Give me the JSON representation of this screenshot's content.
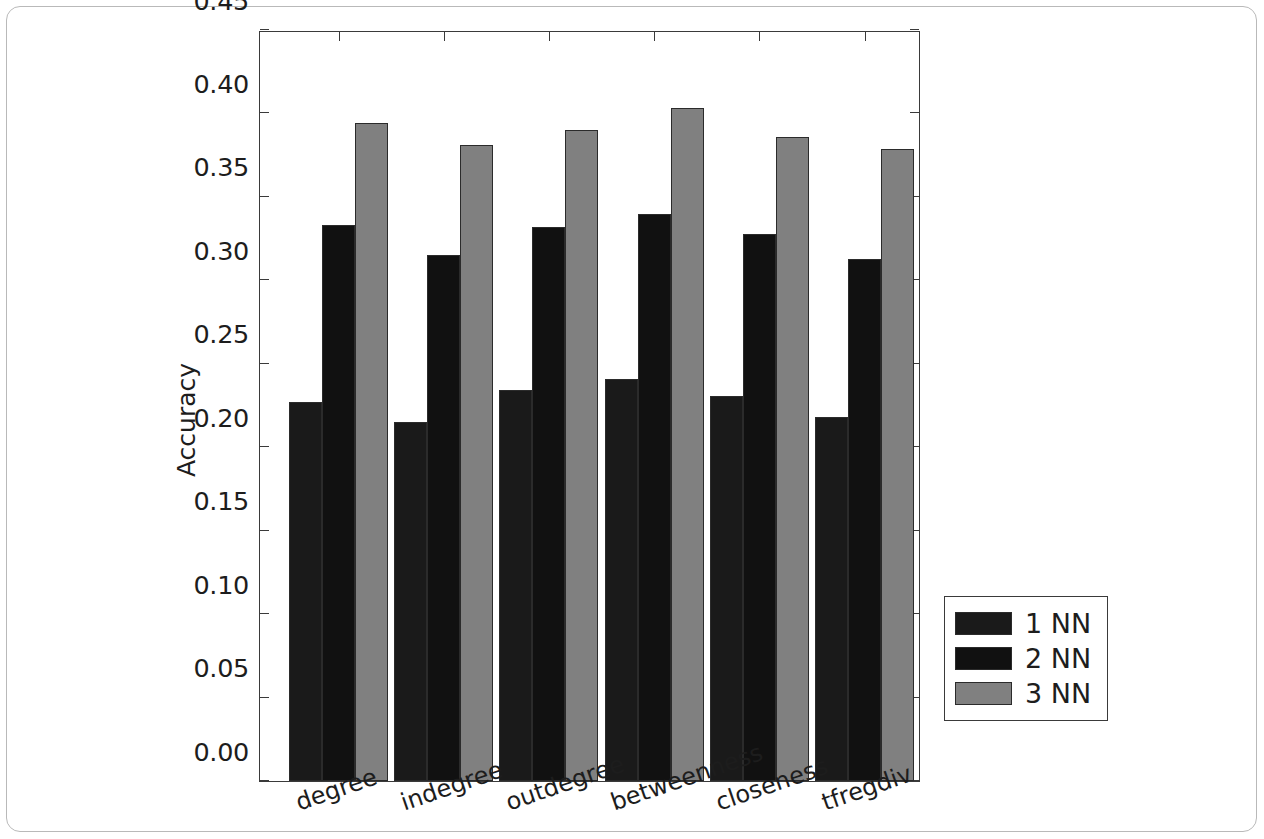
{
  "chart_data": {
    "type": "bar",
    "title": "",
    "xlabel": "",
    "ylabel": "Accuracy",
    "categories": [
      "degree",
      "indegree",
      "outdegree",
      "betweenness",
      "closeness",
      "tfregdiv"
    ],
    "series": [
      {
        "name": "1 NN",
        "color": "#1a1a1a",
        "values": [
          0.227,
          0.215,
          0.234,
          0.241,
          0.231,
          0.218
        ]
      },
      {
        "name": "2 NN",
        "color": "#111111",
        "values": [
          0.333,
          0.315,
          0.332,
          0.34,
          0.328,
          0.313
        ]
      },
      {
        "name": "3 NN",
        "color": "#808080",
        "values": [
          0.394,
          0.381,
          0.39,
          0.403,
          0.386,
          0.379
        ]
      }
    ],
    "ylim": [
      0.0,
      0.45
    ],
    "ytick_labels": [
      "0.00",
      "0.05",
      "0.10",
      "0.15",
      "0.20",
      "0.25",
      "0.30",
      "0.35",
      "0.40",
      "0.45"
    ],
    "ytick_values": [
      0.0,
      0.05,
      0.1,
      0.15,
      0.2,
      0.25,
      0.3,
      0.35,
      0.4,
      0.45
    ],
    "grid": false,
    "legend_position": "right-outside",
    "legend_entries": [
      "1 NN",
      "2 NN",
      "3 NN"
    ],
    "axis_color": "#3a3a3a",
    "figure_background": "#ffffff"
  }
}
